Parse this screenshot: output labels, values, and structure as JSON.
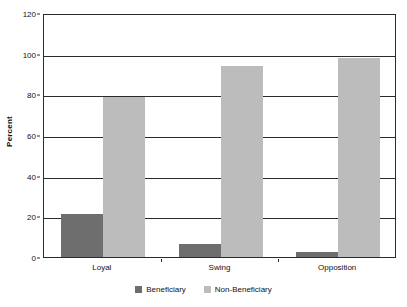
{
  "chart_data": {
    "type": "bar",
    "title": "",
    "xlabel": "",
    "ylabel": "Percent",
    "categories": [
      "Loyal",
      "Swing",
      "Opposition"
    ],
    "series": [
      {
        "name": "Beneficiary",
        "color": "#6e6e6e",
        "values": [
          21,
          6.5,
          2.5
        ]
      },
      {
        "name": "Non-Beneficiary",
        "color": "#bcbcbc",
        "values": [
          78.5,
          94,
          98
        ]
      }
    ],
    "ylim": [
      0,
      120
    ],
    "yticks": [
      0,
      20,
      40,
      60,
      80,
      100,
      120
    ],
    "ytick_labels": [
      "0",
      "20",
      "40",
      "60",
      "80",
      "100",
      "120"
    ],
    "grid": true,
    "legend_position": "bottom"
  },
  "legend": {
    "items": [
      {
        "label": "Beneficiary",
        "color": "#6e6e6e"
      },
      {
        "label": "Non-Beneficiary",
        "color": "#bcbcbc"
      }
    ]
  }
}
